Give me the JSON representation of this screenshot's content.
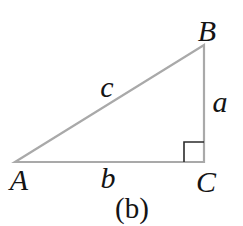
{
  "figure": {
    "type": "right-triangle-diagram",
    "caption": "(b)",
    "right_angle_at_vertex": "C",
    "vertices": [
      {
        "label": "A",
        "position": "bottom-left"
      },
      {
        "label": "B",
        "position": "top-right"
      },
      {
        "label": "C",
        "position": "bottom-right"
      }
    ],
    "sides": [
      {
        "label": "a",
        "between": "B-C",
        "position": "right-vertical"
      },
      {
        "label": "b",
        "between": "A-C",
        "position": "bottom-horizontal"
      },
      {
        "label": "c",
        "between": "A-B",
        "position": "hypotenuse"
      }
    ],
    "colors": {
      "triangle_stroke": "#a9a9a9",
      "right_angle_marker": "#2b2b2b",
      "text": "#141414",
      "background": "#ffffff"
    }
  }
}
